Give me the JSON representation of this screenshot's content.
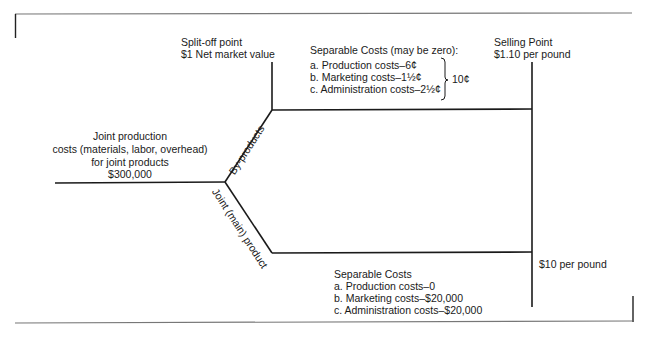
{
  "split_off": {
    "title": "Split-off point",
    "value": "$1 Net market value"
  },
  "joint_costs": {
    "line1": "Joint production",
    "line2": "costs (materials, labor, overhead)",
    "line3": "for joint products",
    "amount": "$300,000"
  },
  "branches": {
    "by_products_label": "By-products",
    "main_product_label": "Joint (main) product"
  },
  "by_product_costs": {
    "title": "Separable Costs (may be zero):",
    "items": [
      "a. Production costs–6¢",
      "b. Marketing costs–1½¢",
      "c. Administration costs–2½¢"
    ],
    "total": "10¢"
  },
  "selling_point": {
    "title": "Selling Point",
    "by_product_price": "$1.10 per pound",
    "main_product_price": "$10 per pound"
  },
  "main_product_costs": {
    "title": "Separable Costs",
    "items": [
      "a. Production costs–0",
      "b. Marketing costs–$20,000",
      "c. Administration costs–$20,000"
    ]
  },
  "colors": {
    "line": "#1a1a1a",
    "frame": "#777777",
    "text": "#1a1a1a"
  }
}
